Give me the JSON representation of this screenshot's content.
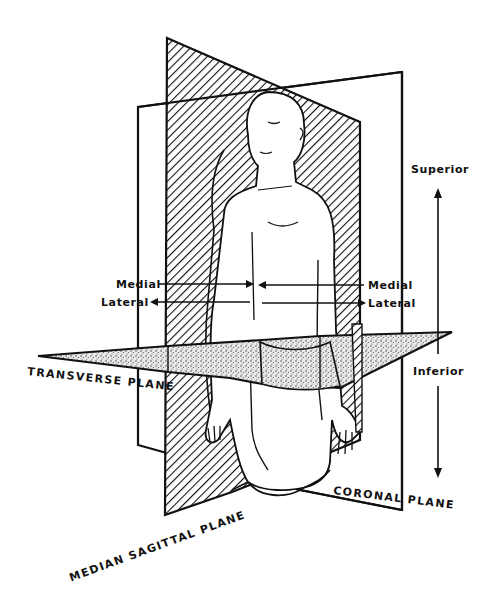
{
  "diagram": {
    "type": "anatomical-planes-illustration",
    "colors": {
      "ink": "#111111",
      "background": "#ffffff",
      "stipple": "#9a9a9a"
    },
    "planes": [
      {
        "id": "sagittal",
        "label": "MEDIAN SAGITTAL PLANE",
        "fill": "diagonal-hatching"
      },
      {
        "id": "coronal",
        "label": "CORONAL PLANE",
        "fill": "none"
      },
      {
        "id": "transverse",
        "label": "TRANSVERSE PLANE",
        "fill": "stipple"
      }
    ],
    "directions": {
      "superior": "Superior",
      "inferior": "Inferior",
      "medial_left": "Medial",
      "lateral_left": "Lateral",
      "medial_right": "Medial",
      "lateral_right": "Lateral"
    }
  }
}
